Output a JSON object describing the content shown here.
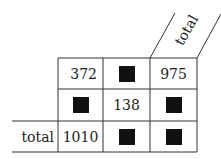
{
  "table": {
    "column_header": "total",
    "row_label": "total",
    "rows": [
      [
        "372",
        null,
        "975"
      ],
      [
        null,
        "138",
        null
      ],
      [
        "1010",
        null,
        null
      ]
    ],
    "hidden_cell": "black-square"
  }
}
